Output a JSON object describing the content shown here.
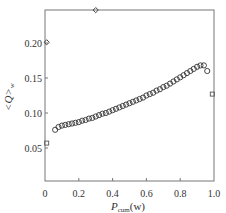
{
  "chart_data": {
    "type": "scatter",
    "title": "",
    "xlabel": "P_cum(w)",
    "xlabel_main": "P",
    "xlabel_sub": "cum",
    "xlabel_tail": "(w)",
    "ylabel": "<Q>_w",
    "ylabel_main": "<Q>",
    "ylabel_sub": "w",
    "xlim": [
      0,
      1.0
    ],
    "ylim": [
      0.0035,
      0.248
    ],
    "xticks": [
      0,
      0.2,
      0.4,
      0.6,
      0.8,
      1.0
    ],
    "xtick_labels": [
      "0",
      "0.2",
      "0.4",
      "0.6",
      "0.8",
      "1.0"
    ],
    "yticks": [
      0.05,
      0.1,
      0.15,
      0.2
    ],
    "ytick_labels": [
      "0.05",
      "0.10",
      "0.15",
      "0.20"
    ],
    "grid": false,
    "legend": null,
    "series": [
      {
        "name": "main",
        "marker": "circle",
        "x": [
          0.06,
          0.08,
          0.1,
          0.12,
          0.14,
          0.16,
          0.18,
          0.2,
          0.22,
          0.24,
          0.26,
          0.28,
          0.3,
          0.32,
          0.34,
          0.36,
          0.38,
          0.4,
          0.42,
          0.44,
          0.46,
          0.48,
          0.5,
          0.52,
          0.54,
          0.56,
          0.58,
          0.6,
          0.62,
          0.64,
          0.66,
          0.68,
          0.7,
          0.72,
          0.74,
          0.76,
          0.78,
          0.8,
          0.82,
          0.84,
          0.86,
          0.88,
          0.9,
          0.92,
          0.94,
          0.96
        ],
        "y": [
          0.076,
          0.08,
          0.082,
          0.083,
          0.084,
          0.085,
          0.086,
          0.087,
          0.089,
          0.09,
          0.092,
          0.093,
          0.095,
          0.097,
          0.099,
          0.1,
          0.102,
          0.104,
          0.106,
          0.108,
          0.11,
          0.112,
          0.114,
          0.116,
          0.118,
          0.12,
          0.122,
          0.125,
          0.127,
          0.129,
          0.132,
          0.134,
          0.137,
          0.139,
          0.142,
          0.145,
          0.148,
          0.151,
          0.154,
          0.157,
          0.16,
          0.163,
          0.166,
          0.168,
          0.168,
          0.16
        ]
      },
      {
        "name": "outliers",
        "marker": "diamond",
        "x": [
          0.01,
          0.3,
          0.01,
          0.99
        ],
        "y": [
          0.201,
          0.247,
          0.057,
          0.127
        ]
      }
    ]
  }
}
